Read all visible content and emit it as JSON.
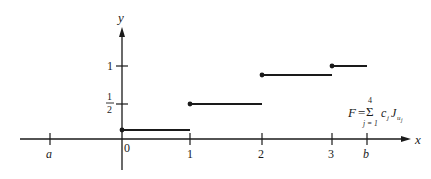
{
  "axes": {
    "x_label": "x",
    "y_label": "y"
  },
  "x_ticks": [
    {
      "label": "a",
      "px": 50,
      "italic": true
    },
    {
      "label": "0",
      "px": 122,
      "italic": false
    },
    {
      "label": "1",
      "px": 190,
      "italic": false
    },
    {
      "label": "2",
      "px": 262,
      "italic": false
    },
    {
      "label": "3",
      "px": 332,
      "italic": false
    },
    {
      "label": "b",
      "px": 367,
      "italic": true
    }
  ],
  "y_ticks": [
    {
      "label": "1",
      "py": 66
    },
    {
      "label_num": "1",
      "label_den": "2",
      "py": 104
    }
  ],
  "steps": [
    {
      "x_start": 0,
      "x_end": 1,
      "y": 0.2,
      "px_start": 122,
      "px_end": 190,
      "py": 130
    },
    {
      "x_start": 1,
      "x_end": 2,
      "y": 0.5,
      "px_start": 190,
      "px_end": 262,
      "py": 104
    },
    {
      "x_start": 2,
      "x_end": 3,
      "y": 0.85,
      "px_start": 262,
      "px_end": 332,
      "py": 75
    },
    {
      "x_start": 3,
      "x_end": "b",
      "y": 1.0,
      "px_start": 332,
      "px_end": 367,
      "py": 66
    }
  ],
  "formula": {
    "lhs": "F",
    "equals": "=",
    "sum_symbol": "Σ",
    "upper": "4",
    "lower": "j = 1",
    "term_c": "c",
    "term_c_sub": "j",
    "term_J": "J",
    "term_J_sub": "u",
    "term_J_subsub": "j"
  },
  "colors": {
    "ink": "#1a1a1a",
    "background": "#ffffff"
  }
}
